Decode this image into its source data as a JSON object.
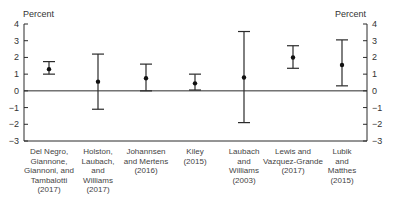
{
  "chart_data": {
    "type": "scatter",
    "subtype": "point-with-error-bars",
    "title": "",
    "xlabel": "",
    "ylabel": "Percent",
    "ylabel_right": "Percent",
    "ylim": [
      -3,
      4
    ],
    "yticks": [
      -3,
      -2,
      -1,
      0,
      1,
      2,
      3,
      4
    ],
    "ytick_labels": [
      "−3",
      "−2",
      "−1",
      "0",
      "1",
      "2",
      "3",
      "4"
    ],
    "grid": false,
    "zero_line": true,
    "categories": [
      "Del Negro,\nGiannone,\nGiannoni, and\nTambalotti\n(2017)",
      "Holston,\nLaubach,\nand\nWilliams\n(2017)",
      "Johannsen\nand Mertens\n(2016)",
      "Kiley\n(2015)",
      "Laubach\nand\nWilliams\n(2003)",
      "Lewis and\nVazquez-Grande\n(2017)",
      "Lubik\nand\nMatthes\n(2015)"
    ],
    "series": [
      {
        "name": "Estimate",
        "values": [
          1.3,
          0.55,
          0.75,
          0.45,
          0.8,
          2.0,
          1.55
        ],
        "lower": [
          1.0,
          -1.1,
          0.0,
          0.05,
          -1.9,
          1.35,
          0.3
        ],
        "upper": [
          1.75,
          2.2,
          1.6,
          1.0,
          3.55,
          2.7,
          3.05
        ]
      }
    ]
  },
  "axis": {
    "left_unit": "Percent",
    "right_unit": "Percent"
  }
}
